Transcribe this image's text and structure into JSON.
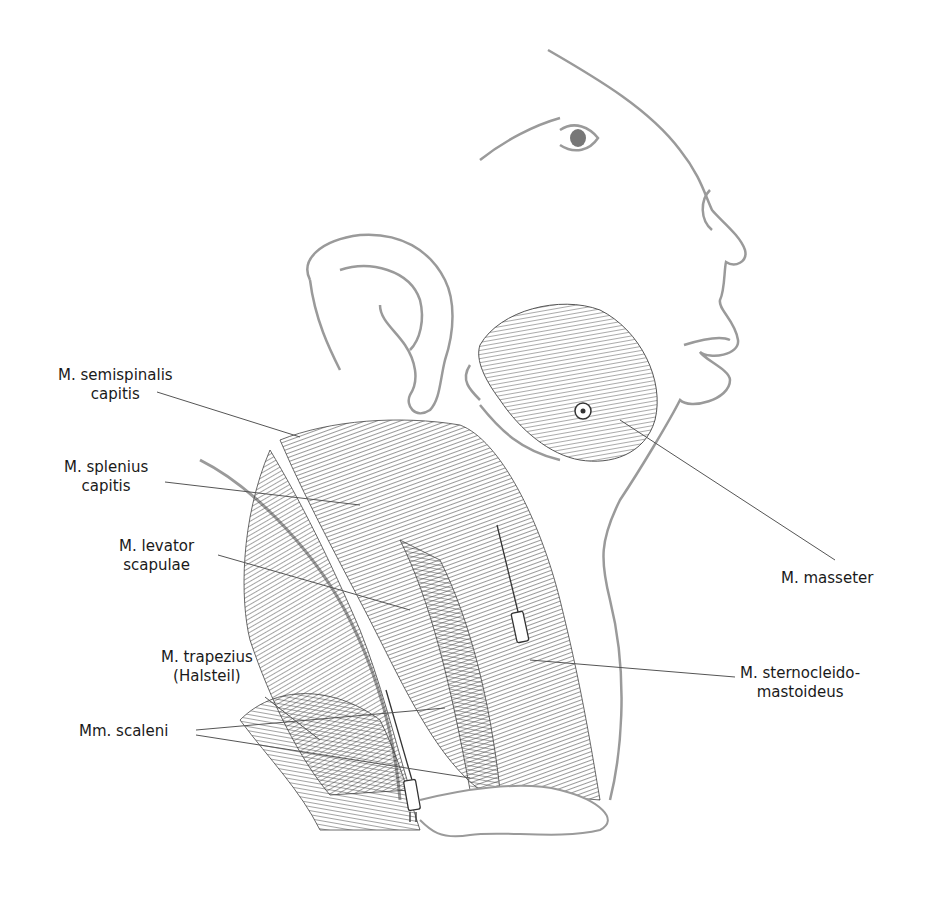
{
  "diagram": {
    "colors": {
      "outline": "#9a9a9a",
      "muscle": "#2a2a2a",
      "leader": "#555555",
      "text": "#1a1a1a"
    }
  },
  "labels": [
    {
      "id": "semispinalis",
      "lines": [
        "M. semispinalis",
        "capitis"
      ]
    },
    {
      "id": "splenius",
      "lines": [
        "M. splenius",
        "capitis"
      ]
    },
    {
      "id": "levator",
      "lines": [
        "M. levator",
        "scapulae"
      ]
    },
    {
      "id": "trapezius",
      "lines": [
        "M. trapezius",
        "(Halsteil)"
      ]
    },
    {
      "id": "scaleni",
      "lines": [
        "Mm. scaleni"
      ]
    },
    {
      "id": "masseter",
      "lines": [
        "M. masseter"
      ]
    },
    {
      "id": "sternocleido",
      "lines": [
        "M. sternocleido-",
        "mastoideus"
      ]
    }
  ]
}
